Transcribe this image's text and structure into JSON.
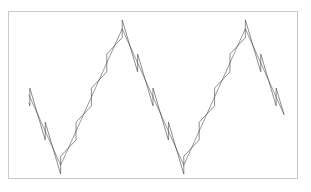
{
  "figure": {
    "background_color": "#ffffff",
    "frame": {
      "x": 8,
      "y": 11,
      "width": 290,
      "height": 168,
      "border_color": "#c9c9c9",
      "fill_color": "#ffffff"
    }
  },
  "chart_data": {
    "type": "line",
    "title": "",
    "subtitle": "",
    "xlabel": "",
    "ylabel": "",
    "grid": false,
    "legend": [],
    "legend_position": "none",
    "axes_visible": false,
    "tick_labels_x": [],
    "tick_labels_y": [],
    "xlim": [
      0,
      290
    ],
    "ylim": [
      0,
      168
    ],
    "annotations": [],
    "series": [
      {
        "name": "triangle-wave",
        "color": "#555555",
        "line_width": 0.6,
        "waveform": "triangle",
        "amplitude": 69,
        "period": 124,
        "phase_x": 60,
        "baseline_y": 97,
        "peak_y": 28,
        "trough_y": 166,
        "peaks_x": [
          60,
          184
        ],
        "troughs_x": [
          124,
          247
        ],
        "x_start": 28,
        "x_end": 285
      },
      {
        "name": "triangle-plus-sawtooth-wave",
        "color": "#404040",
        "line_width": 0.6,
        "waveform": "triangle+sawtooth",
        "amplitude": 69,
        "period": 124,
        "sawtooth_period": 15.5,
        "sawtooth_amplitude": 9,
        "phase_x": 60,
        "baseline_y": 97,
        "peak_y": 28,
        "trough_y": 166,
        "x_start": 28,
        "x_end": 285
      }
    ]
  }
}
